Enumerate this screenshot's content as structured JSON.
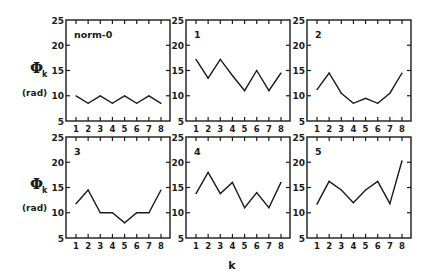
{
  "chart_data": {
    "type": "line",
    "layout": "2x3 small multiples",
    "xlabel": "k",
    "ylabel": "Φk",
    "ylabel_symbol": "Φ",
    "ylabel_subscript": "k",
    "ylabel_unit": "(rad)",
    "x": [
      1,
      2,
      3,
      4,
      5,
      6,
      7,
      8
    ],
    "xticks": [
      "1",
      "2",
      "3",
      "4",
      "5",
      "6",
      "7",
      "8"
    ],
    "ylim": [
      5,
      25
    ],
    "yticks": [
      "5",
      "10",
      "15",
      "20",
      "25"
    ],
    "grid": false,
    "panels": [
      {
        "title": "norm-0",
        "values": [
          10.0,
          8.5,
          10.0,
          8.5,
          10.0,
          8.5,
          10.0,
          8.5
        ]
      },
      {
        "title": "1",
        "values": [
          17.2,
          13.5,
          17.2,
          14.0,
          11.0,
          15.0,
          11.0,
          14.5
        ]
      },
      {
        "title": "2",
        "values": [
          11.2,
          14.5,
          10.5,
          8.5,
          9.5,
          8.5,
          10.5,
          14.5
        ]
      },
      {
        "title": "3",
        "values": [
          11.8,
          14.5,
          10.0,
          10.0,
          8.0,
          10.0,
          10.0,
          14.5
        ]
      },
      {
        "title": "4",
        "values": [
          13.8,
          18.0,
          13.8,
          16.0,
          11.0,
          14.0,
          11.0,
          16.0
        ]
      },
      {
        "title": "5",
        "values": [
          11.7,
          16.2,
          14.5,
          12.0,
          14.5,
          16.2,
          11.8,
          20.3
        ]
      }
    ]
  }
}
